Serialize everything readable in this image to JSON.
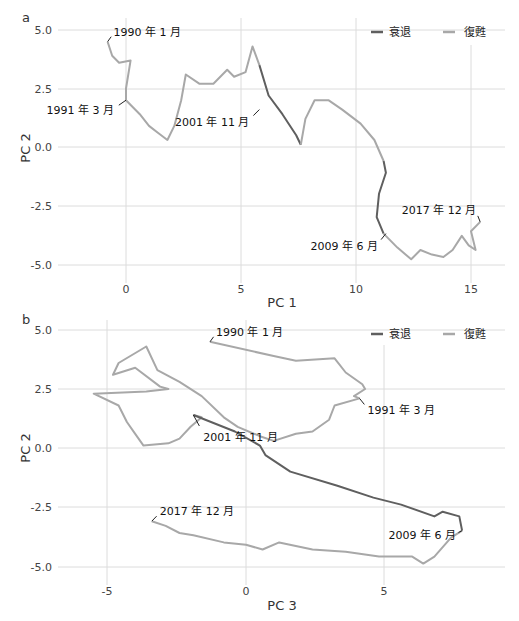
{
  "colors": {
    "recession": "#5f5f5f",
    "recovery": "#a8a8a8",
    "grid": "#dcdcdc"
  },
  "legend": {
    "recession": "衰退",
    "recovery": "復甦"
  },
  "chart_data": [
    {
      "panel": "a",
      "type": "line",
      "title": "",
      "xlabel": "PC 1",
      "ylabel": "PC 2",
      "xticks": [
        "0",
        "5",
        "10",
        "15"
      ],
      "yticks": [
        "5.0",
        "2.5",
        "0.0",
        "-2.5",
        "-5.0"
      ],
      "xlim": [
        -2.9,
        16.5
      ],
      "ylim": [
        -5.8,
        5.6
      ],
      "grid": true,
      "legend_position": "top-right",
      "annotations": [
        {
          "label": "1990 年 1 月",
          "x": -0.8,
          "y": 4.5
        },
        {
          "label": "1991 年 3 月",
          "x": 0.0,
          "y": 2.0
        },
        {
          "label": "2001 年 11 月",
          "x": 5.8,
          "y": 1.6
        },
        {
          "label": "2009 年 6 月",
          "x": 11.3,
          "y": -3.7
        },
        {
          "label": "2017 年 12 月",
          "x": 15.4,
          "y": -3.2
        }
      ],
      "series": [
        {
          "name": "復甦",
          "segment": "1990-01 to 1991-03",
          "points": [
            [
              -0.8,
              4.5
            ],
            [
              -0.6,
              3.9
            ],
            [
              -0.3,
              3.6
            ],
            [
              0.2,
              3.7
            ],
            [
              0.0,
              2.5
            ],
            [
              0.0,
              2.0
            ]
          ]
        },
        {
          "name": "復甦",
          "segment": "1991-03 to 2001-11",
          "points": [
            [
              0.0,
              2.0
            ],
            [
              0.6,
              1.4
            ],
            [
              1.0,
              0.9
            ],
            [
              1.4,
              0.6
            ],
            [
              1.8,
              0.3
            ],
            [
              2.1,
              0.9
            ],
            [
              2.4,
              2.0
            ],
            [
              2.6,
              3.1
            ],
            [
              3.2,
              2.7
            ],
            [
              3.8,
              2.7
            ],
            [
              4.4,
              3.3
            ],
            [
              4.7,
              3.0
            ],
            [
              5.2,
              3.2
            ],
            [
              5.5,
              4.3
            ],
            [
              5.8,
              3.5
            ]
          ]
        },
        {
          "name": "衰退",
          "segment": "2001-11",
          "points": [
            [
              5.8,
              3.5
            ],
            [
              6.2,
              2.2
            ],
            [
              6.8,
              1.4
            ],
            [
              7.4,
              0.5
            ],
            [
              7.6,
              0.1
            ]
          ]
        },
        {
          "name": "復甦",
          "segment": "2001-11 to 2008",
          "points": [
            [
              7.6,
              0.1
            ],
            [
              7.8,
              1.2
            ],
            [
              8.2,
              2.0
            ],
            [
              8.8,
              2.0
            ],
            [
              9.4,
              1.6
            ],
            [
              10.2,
              1.0
            ],
            [
              10.8,
              0.3
            ],
            [
              11.2,
              -0.6
            ]
          ]
        },
        {
          "name": "衰退",
          "segment": "2008-2009",
          "points": [
            [
              11.2,
              -0.6
            ],
            [
              11.3,
              -1.1
            ],
            [
              11.0,
              -2.0
            ],
            [
              10.9,
              -3.0
            ],
            [
              11.2,
              -3.7
            ]
          ]
        },
        {
          "name": "復甦",
          "segment": "2009-06 to 2017-12",
          "points": [
            [
              11.2,
              -3.7
            ],
            [
              11.8,
              -4.3
            ],
            [
              12.4,
              -4.8
            ],
            [
              12.8,
              -4.4
            ],
            [
              13.3,
              -4.6
            ],
            [
              13.8,
              -4.7
            ],
            [
              14.2,
              -4.4
            ],
            [
              14.6,
              -3.8
            ],
            [
              14.9,
              -4.2
            ],
            [
              15.2,
              -4.4
            ],
            [
              15.0,
              -3.6
            ],
            [
              15.4,
              -3.2
            ]
          ]
        }
      ]
    },
    {
      "panel": "b",
      "type": "line",
      "title": "",
      "xlabel": "PC 3",
      "ylabel": "PC 2",
      "xticks": [
        "-5",
        "0",
        "5"
      ],
      "yticks": [
        "5.0",
        "2.5",
        "0.0",
        "-2.5",
        "-5.0"
      ],
      "xlim": [
        -6.5,
        8.5
      ],
      "ylim": [
        -5.6,
        5.6
      ],
      "grid": true,
      "legend_position": "top-right",
      "annotations": [
        {
          "label": "1990 年 1 月",
          "x": -1.3,
          "y": 4.5
        },
        {
          "label": "1991 年 3 月",
          "x": 4.1,
          "y": 2.1
        },
        {
          "label": "2001 年 11 月",
          "x": -1.9,
          "y": 1.4
        },
        {
          "label": "2009 年 6 月",
          "x": 7.8,
          "y": -3.5
        },
        {
          "label": "2017 年 12 月",
          "x": -3.4,
          "y": -3.1
        }
      ],
      "series": [
        {
          "name": "復甦",
          "segment": "1990-01 to 1991-03",
          "points": [
            [
              -1.3,
              4.5
            ],
            [
              1.0,
              3.9
            ],
            [
              1.8,
              3.7
            ],
            [
              3.2,
              3.8
            ],
            [
              3.6,
              3.2
            ],
            [
              4.2,
              2.7
            ],
            [
              4.3,
              2.5
            ],
            [
              3.9,
              2.2
            ],
            [
              4.1,
              2.1
            ]
          ]
        },
        {
          "name": "復甦",
          "segment": "1991-03 to 2001-11",
          "points": [
            [
              4.1,
              2.1
            ],
            [
              3.2,
              1.8
            ],
            [
              3.0,
              1.2
            ],
            [
              2.4,
              0.7
            ],
            [
              1.8,
              0.6
            ],
            [
              1.0,
              0.3
            ],
            [
              0.5,
              0.5
            ],
            [
              -0.3,
              0.9
            ],
            [
              -0.8,
              1.3
            ],
            [
              -1.6,
              2.2
            ],
            [
              -2.4,
              2.8
            ],
            [
              -3.2,
              3.3
            ],
            [
              -3.6,
              4.3
            ],
            [
              -4.6,
              3.6
            ],
            [
              -4.8,
              3.1
            ],
            [
              -4.0,
              3.4
            ],
            [
              -3.1,
              2.6
            ],
            [
              -2.8,
              2.5
            ],
            [
              -3.6,
              2.4
            ],
            [
              -5.5,
              2.3
            ],
            [
              -4.6,
              1.8
            ],
            [
              -4.3,
              1.1
            ],
            [
              -4.0,
              0.6
            ],
            [
              -3.7,
              0.1
            ],
            [
              -2.8,
              0.2
            ],
            [
              -2.4,
              0.4
            ],
            [
              -2.0,
              0.9
            ],
            [
              -1.6,
              1.3
            ],
            [
              -1.9,
              1.4
            ]
          ]
        },
        {
          "name": "衰退",
          "segment": "2001-11 and 2008-2009",
          "points": [
            [
              -1.9,
              1.4
            ],
            [
              -0.4,
              0.7
            ],
            [
              0.5,
              0.1
            ],
            [
              0.7,
              -0.3
            ],
            [
              1.6,
              -1.0
            ],
            [
              3.3,
              -1.6
            ],
            [
              4.6,
              -2.1
            ],
            [
              5.6,
              -2.4
            ],
            [
              6.8,
              -2.9
            ],
            [
              7.1,
              -2.7
            ],
            [
              7.7,
              -2.9
            ],
            [
              7.8,
              -3.5
            ]
          ]
        },
        {
          "name": "復甦",
          "segment": "2009-06 to 2017-12",
          "points": [
            [
              7.8,
              -3.5
            ],
            [
              7.4,
              -3.8
            ],
            [
              6.8,
              -4.6
            ],
            [
              6.4,
              -4.9
            ],
            [
              6.0,
              -4.6
            ],
            [
              5.6,
              -4.6
            ],
            [
              4.8,
              -4.6
            ],
            [
              3.6,
              -4.4
            ],
            [
              2.4,
              -4.3
            ],
            [
              1.2,
              -4.0
            ],
            [
              0.6,
              -4.3
            ],
            [
              0.0,
              -4.1
            ],
            [
              -0.8,
              -4.0
            ],
            [
              -1.9,
              -3.7
            ],
            [
              -2.4,
              -3.6
            ],
            [
              -2.9,
              -3.3
            ],
            [
              -3.4,
              -3.1
            ]
          ]
        }
      ]
    }
  ],
  "panels": {
    "a": {
      "letter": "a",
      "xlabel": "PC 1",
      "ylabel": "PC 2"
    },
    "b": {
      "letter": "b",
      "xlabel": "PC 3",
      "ylabel": "PC 2"
    }
  }
}
